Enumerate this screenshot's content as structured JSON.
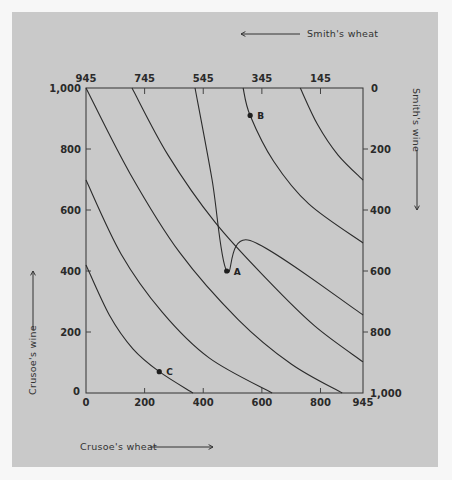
{
  "chart_data": {
    "type": "line",
    "title": "",
    "xlabel": "Crusoe's wheat",
    "ylabel": "Crusoe's wine",
    "top_label": "Smith's wheat",
    "right_label": "Smith's wine",
    "xlim": [
      0,
      945
    ],
    "ylim": [
      0,
      1000
    ],
    "grid": false,
    "bottom_ticks": [
      "0",
      "200",
      "400",
      "600",
      "800",
      "945"
    ],
    "bottom_tick_values": [
      0,
      200,
      400,
      600,
      800,
      945
    ],
    "left_ticks": [
      "0",
      "200",
      "400",
      "600",
      "800",
      "1,000"
    ],
    "left_tick_values": [
      0,
      200,
      400,
      600,
      800,
      1000
    ],
    "top_ticks": [
      "945",
      "745",
      "545",
      "345",
      "145",
      "0"
    ],
    "top_tick_values": [
      945,
      745,
      545,
      345,
      145,
      0
    ],
    "right_ticks": [
      "0",
      "200",
      "400",
      "600",
      "800",
      "1,000"
    ],
    "right_tick_values": [
      0,
      200,
      400,
      600,
      800,
      1000
    ],
    "series": [
      {
        "name": "curve-1",
        "points": [
          [
            0,
            420
          ],
          [
            80,
            255
          ],
          [
            160,
            145
          ],
          [
            250,
            70
          ],
          [
            365,
            0
          ]
        ]
      },
      {
        "name": "curve-2",
        "points": [
          [
            0,
            698
          ],
          [
            120,
            455
          ],
          [
            260,
            265
          ],
          [
            420,
            115
          ],
          [
            635,
            0
          ]
        ]
      },
      {
        "name": "curve-3",
        "points": [
          [
            0,
            1000
          ],
          [
            150,
            720
          ],
          [
            320,
            460
          ],
          [
            520,
            240
          ],
          [
            700,
            95
          ],
          [
            874,
            0
          ]
        ]
      },
      {
        "name": "curve-4",
        "points": [
          [
            157,
            1000
          ],
          [
            280,
            780
          ],
          [
            440,
            560
          ],
          [
            620,
            370
          ],
          [
            780,
            220
          ],
          [
            945,
            102
          ]
        ]
      },
      {
        "name": "curve-5",
        "points": [
          [
            372,
            1000
          ],
          [
            430,
            700
          ],
          [
            480,
            400
          ],
          [
            560,
            500
          ],
          [
            945,
            256
          ]
        ]
      },
      {
        "name": "curve-6",
        "points": [
          [
            536,
            1000
          ],
          [
            560,
            910
          ],
          [
            640,
            760
          ],
          [
            760,
            620
          ],
          [
            945,
            492
          ]
        ]
      },
      {
        "name": "curve-7",
        "points": [
          [
            731,
            1000
          ],
          [
            790,
            880
          ],
          [
            860,
            780
          ],
          [
            945,
            698
          ]
        ]
      }
    ],
    "points": [
      {
        "label": "A",
        "x": 480,
        "y": 400
      },
      {
        "label": "B",
        "x": 560,
        "y": 910
      },
      {
        "label": "C",
        "x": 250,
        "y": 70
      }
    ]
  }
}
